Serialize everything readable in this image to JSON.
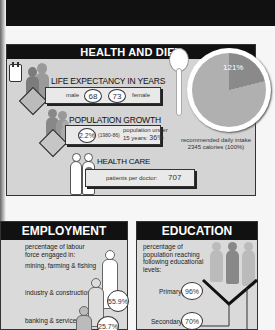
{
  "health": {
    "title": "HEALTH AND DIET",
    "life_expectancy": {
      "title": "LIFE EXPECTANCY IN YEARS",
      "male_label": "male",
      "male_value": "68",
      "female_value": "73",
      "female_label": "female"
    },
    "population_growth": {
      "title": "POPULATION GROWTH",
      "rate": "2.2%",
      "period": "(1980-86)",
      "under15_label_1": "population under",
      "under15_label_2": "15 years:",
      "under15_value": "36%"
    },
    "health_care": {
      "title": "HEALTH CARE",
      "patients_label": "patients per doctor:",
      "patients_value": "707"
    },
    "diet": {
      "pie_value": "121%",
      "caption_1": "recommended daily intake",
      "caption_2": "2345 calories (100%)"
    }
  },
  "employment": {
    "title": "EMPLOYMENT",
    "intro_1": "percentage of labour",
    "intro_2": "force engaged in:",
    "sectors": [
      {
        "label": "mining, farming & fishing",
        "value": ""
      },
      {
        "label": "industry & construction",
        "value": "55.9%"
      },
      {
        "label": "banking & services",
        "value": "25.7%"
      }
    ]
  },
  "education": {
    "title": "EDUCATION",
    "intro_1": "percentage of",
    "intro_2": "population reaching",
    "intro_3": "following educational",
    "intro_4": "levels:",
    "levels": [
      {
        "label": "Primary",
        "value": "96%"
      },
      {
        "label": "Secondary",
        "value": "70%"
      }
    ]
  },
  "colors": {
    "panel_bg": "#d4d4d4",
    "header_bg": "#111111",
    "pie_main": "#b0b0b0",
    "pie_slice": "#8a8a8a"
  }
}
